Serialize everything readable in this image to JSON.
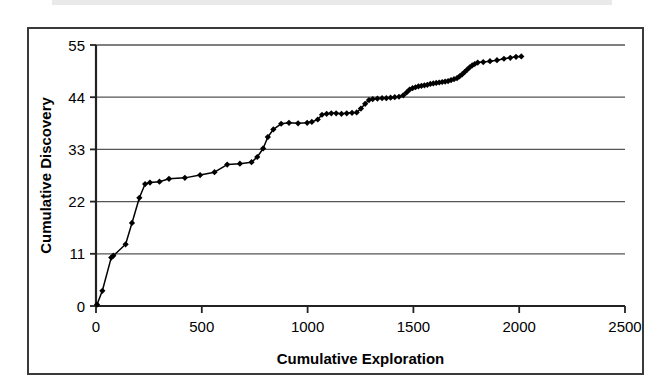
{
  "chart_data": {
    "type": "line",
    "title": "",
    "subtitle": "",
    "xlabel": "Cumulative Exploration",
    "ylabel": "Cumulative Discovery",
    "xlim": [
      0,
      2500
    ],
    "ylim": [
      0,
      55
    ],
    "xticks": [
      0,
      500,
      1000,
      1500,
      2000,
      2500
    ],
    "yticks": [
      0,
      11,
      22,
      33,
      44,
      55
    ],
    "xtick_labels": [
      "0",
      "500",
      "1000",
      "1500",
      "2000",
      "2500"
    ],
    "ytick_labels": [
      "0",
      "11",
      "22",
      "33",
      "44",
      "55"
    ],
    "grid": "horizontal",
    "legend": null,
    "legend_position": "none",
    "marker": "diamond",
    "line_color": "#000000",
    "marker_color": "#000000",
    "series": [
      {
        "name": "Cumulative Discovery",
        "points": [
          [
            5,
            0.3
          ],
          [
            30,
            3.2
          ],
          [
            72,
            10.2
          ],
          [
            82,
            10.6
          ],
          [
            140,
            13.0
          ],
          [
            170,
            17.5
          ],
          [
            205,
            22.8
          ],
          [
            232,
            25.7
          ],
          [
            255,
            26.0
          ],
          [
            300,
            26.2
          ],
          [
            345,
            26.8
          ],
          [
            420,
            27.0
          ],
          [
            492,
            27.6
          ],
          [
            560,
            28.2
          ],
          [
            620,
            29.8
          ],
          [
            680,
            30.0
          ],
          [
            735,
            30.3
          ],
          [
            762,
            31.4
          ],
          [
            790,
            33.2
          ],
          [
            812,
            35.6
          ],
          [
            838,
            37.2
          ],
          [
            875,
            38.4
          ],
          [
            912,
            38.6
          ],
          [
            955,
            38.5
          ],
          [
            998,
            38.6
          ],
          [
            1020,
            38.8
          ],
          [
            1048,
            39.3
          ],
          [
            1068,
            40.3
          ],
          [
            1090,
            40.5
          ],
          [
            1112,
            40.6
          ],
          [
            1135,
            40.6
          ],
          [
            1160,
            40.5
          ],
          [
            1185,
            40.6
          ],
          [
            1210,
            40.7
          ],
          [
            1232,
            40.8
          ],
          [
            1252,
            41.6
          ],
          [
            1272,
            42.6
          ],
          [
            1290,
            43.4
          ],
          [
            1308,
            43.6
          ],
          [
            1330,
            43.7
          ],
          [
            1352,
            43.8
          ],
          [
            1372,
            43.8
          ],
          [
            1392,
            43.9
          ],
          [
            1412,
            44.0
          ],
          [
            1432,
            44.1
          ],
          [
            1452,
            44.4
          ],
          [
            1468,
            45.0
          ],
          [
            1482,
            45.6
          ],
          [
            1496,
            45.9
          ],
          [
            1510,
            46.1
          ],
          [
            1524,
            46.3
          ],
          [
            1538,
            46.4
          ],
          [
            1552,
            46.5
          ],
          [
            1566,
            46.6
          ],
          [
            1580,
            46.8
          ],
          [
            1594,
            46.9
          ],
          [
            1608,
            47.0
          ],
          [
            1622,
            47.1
          ],
          [
            1636,
            47.2
          ],
          [
            1650,
            47.3
          ],
          [
            1664,
            47.4
          ],
          [
            1678,
            47.6
          ],
          [
            1692,
            47.8
          ],
          [
            1706,
            48.0
          ],
          [
            1718,
            48.4
          ],
          [
            1730,
            48.8
          ],
          [
            1742,
            49.3
          ],
          [
            1754,
            49.8
          ],
          [
            1766,
            50.3
          ],
          [
            1778,
            50.7
          ],
          [
            1790,
            51.0
          ],
          [
            1804,
            51.3
          ],
          [
            1830,
            51.4
          ],
          [
            1862,
            51.6
          ],
          [
            1895,
            51.8
          ],
          [
            1928,
            52.1
          ],
          [
            1958,
            52.3
          ],
          [
            1985,
            52.5
          ],
          [
            2010,
            52.6
          ]
        ]
      }
    ]
  }
}
